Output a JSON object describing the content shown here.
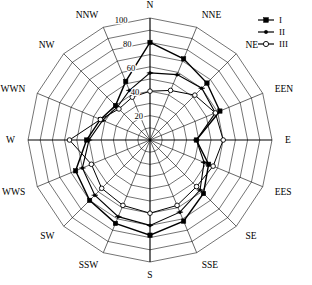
{
  "chart_data": {
    "type": "line",
    "subtype": "radar-polar-wind-rose",
    "title": "",
    "xlabel": "",
    "ylabel": "",
    "grid": true,
    "grid_rings": 10,
    "grid_ring_step": 10,
    "legend_position": "top-right",
    "rlim": [
      0,
      100
    ],
    "radial_tick_labels": [
      "20",
      "40",
      "60",
      "80",
      "100"
    ],
    "radial_tick_values": [
      20,
      40,
      60,
      80,
      100
    ],
    "radial_tick_axis": "N-NNW sector",
    "categories": [
      "N",
      "NNE",
      "NE",
      "EEN",
      "E",
      "EES",
      "SE",
      "SSE",
      "S",
      "SSW",
      "SW",
      "WWS",
      "W",
      "WWN",
      "NW",
      "NNW"
    ],
    "angles_deg": [
      0,
      22.5,
      45,
      67.5,
      90,
      112.5,
      135,
      157.5,
      180,
      202.5,
      225,
      247.5,
      270,
      292.5,
      315,
      337.5
    ],
    "series": [
      {
        "name": "I",
        "marker": "filled-square",
        "values": [
          80,
          72,
          66,
          62,
          38,
          52,
          62,
          72,
          78,
          74,
          70,
          66,
          52,
          44,
          40,
          52
        ]
      },
      {
        "name": "II",
        "marker": "cross-dash",
        "values": [
          55,
          58,
          60,
          58,
          38,
          48,
          58,
          64,
          70,
          68,
          64,
          60,
          50,
          42,
          38,
          44
        ]
      },
      {
        "name": "III",
        "marker": "open-circle",
        "values": [
          40,
          44,
          52,
          58,
          60,
          56,
          54,
          58,
          60,
          58,
          56,
          52,
          66,
          44,
          36,
          38
        ]
      }
    ],
    "annotations": []
  },
  "legend": {
    "entries": [
      {
        "label": "I",
        "marker": "filled-square"
      },
      {
        "label": "II",
        "marker": "cross-dash"
      },
      {
        "label": "III",
        "marker": "open-circle"
      }
    ]
  },
  "geometry": {
    "cx": 150,
    "cy": 140,
    "outer_radius": 122
  }
}
